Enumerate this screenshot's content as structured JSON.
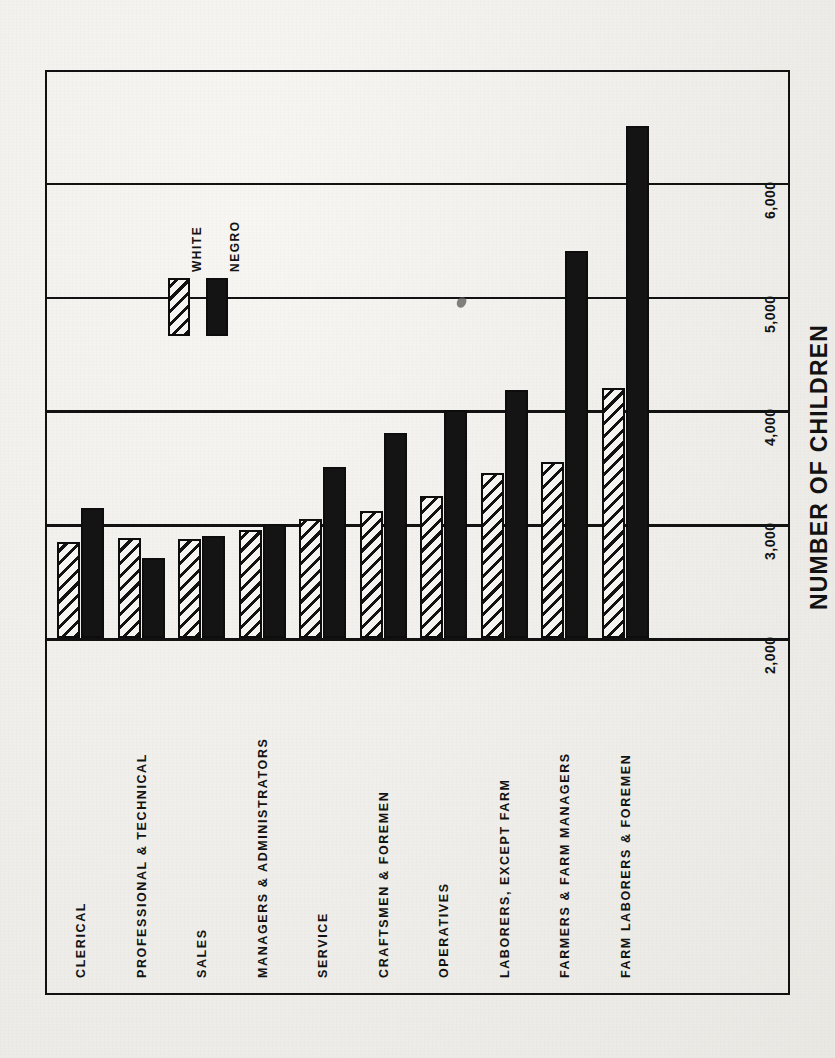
{
  "figure": {
    "axis_title": "NUMBER OF CHILDREN",
    "legend": {
      "white_label": "WHITE",
      "negro_label": "NEGRO"
    }
  },
  "chart_data": {
    "type": "bar",
    "title": "",
    "subtitle": "",
    "orientation": "horizontal-rotated",
    "xlabel": "",
    "ylabel": "NUMBER OF CHILDREN",
    "ylim": [
      2000,
      6800
    ],
    "grid": true,
    "grid_axis": "value",
    "legend_position": "upper-left-inside",
    "tick_labels": [
      "2,000",
      "3,000",
      "4,000",
      "5,000",
      "6,000"
    ],
    "ticks": [
      2000,
      3000,
      4000,
      5000,
      6000
    ],
    "axis_baseline": 2000,
    "categories": [
      "CLERICAL",
      "PROFESSIONAL & TECHNICAL",
      "SALES",
      "MANAGERS & ADMINISTRATORS",
      "SERVICE",
      "CRAFTSMEN & FOREMEN",
      "OPERATIVES",
      "LABORERS, EXCEPT FARM",
      "FARMERS & FARM MANAGERS",
      "FARM LABORERS & FOREMEN"
    ],
    "series": [
      {
        "name": "WHITE",
        "fill": "diagonal-hatch",
        "color": "#121212",
        "values": [
          2840,
          2880,
          2870,
          2950,
          3050,
          3120,
          3250,
          3450,
          3550,
          4200
        ]
      },
      {
        "name": "NEGRO",
        "fill": "solid",
        "color": "#141414",
        "values": [
          3140,
          2700,
          2900,
          3000,
          3500,
          3800,
          4000,
          4180,
          5400,
          6500
        ]
      }
    ]
  },
  "colors": {
    "ink": "#121212",
    "paper": "#f2f1ee",
    "frame": "#111111"
  }
}
